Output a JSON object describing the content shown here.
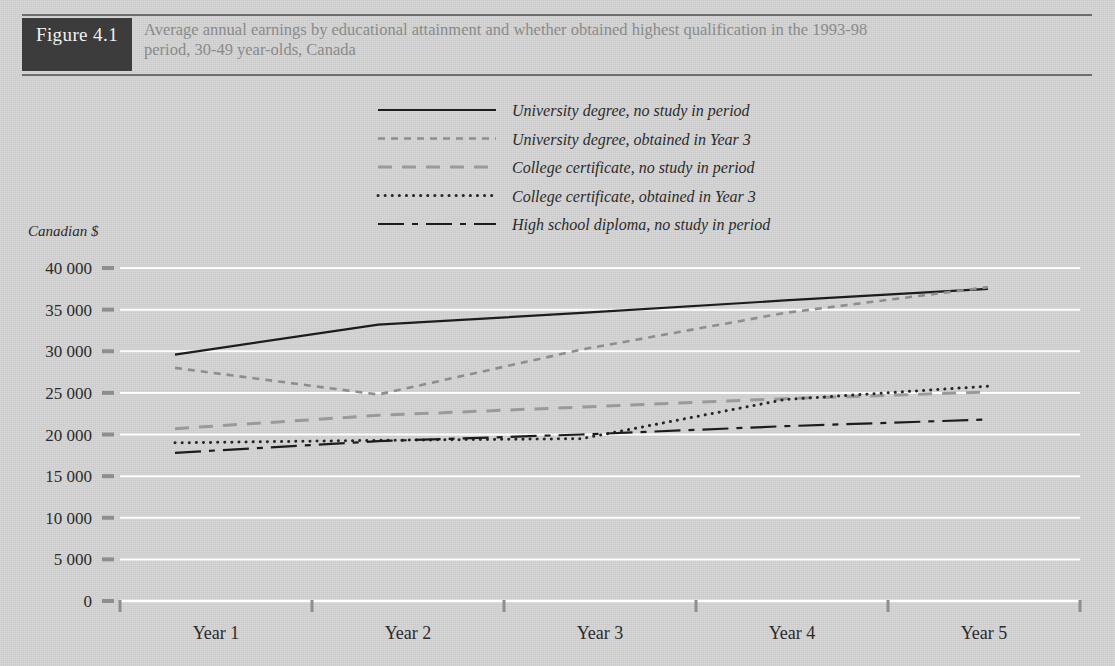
{
  "figure": {
    "badge": "Figure 4.1",
    "title_line1": "Average annual earnings by educational attainment and whether obtained highest qualification in the 1993-98",
    "title_line2": "period, 30-49 year-olds, Canada"
  },
  "colors": {
    "page_background": "#d5d5d5",
    "badge_background": "#3c3c3c",
    "badge_text": "#f2f2f2",
    "title_text": "#8a8a8a",
    "rule": "#6d6d6d",
    "gridline": "#fdfdfd",
    "series_dark": "#1c1c1c",
    "series_mid": "#5a5a5a",
    "series_light": "#9a9a9a"
  },
  "chart_data": {
    "type": "line",
    "title": "Average annual earnings by educational attainment and whether obtained highest qualification in the 1993-98 period, 30-49 year-olds, Canada",
    "xlabel": "",
    "ylabel": "Canadian $",
    "categories": [
      "Year 1",
      "Year 2",
      "Year 3",
      "Year 4",
      "Year 5"
    ],
    "ylim": [
      0,
      40000
    ],
    "ytick_values": [
      0,
      5000,
      10000,
      15000,
      20000,
      25000,
      30000,
      35000,
      40000
    ],
    "ytick_labels": [
      "0",
      "5 000",
      "10 000",
      "15 000",
      "20 000",
      "25 000",
      "30 000",
      "35 000",
      "40 000"
    ],
    "grid": true,
    "legend_position": "top-center",
    "series": [
      {
        "name": "University degree, no study in period",
        "dash": "solid",
        "color": "#1c1c1c",
        "width": 2.2,
        "values": [
          29600,
          33200,
          34600,
          36100,
          37500
        ]
      },
      {
        "name": "University degree, obtained in Year 3",
        "dash": "short-dash",
        "color": "#8e8e8e",
        "width": 2.6,
        "values": [
          28000,
          24800,
          30200,
          34600,
          37700
        ]
      },
      {
        "name": "College certificate, no study in period",
        "dash": "long-dash",
        "color": "#9a9a9a",
        "width": 3.0,
        "values": [
          20700,
          22300,
          23300,
          24300,
          25100
        ]
      },
      {
        "name": "College certificate, obtained in Year 3",
        "dash": "dotted",
        "color": "#262626",
        "width": 3.0,
        "values": [
          19000,
          19300,
          19500,
          24200,
          25800
        ]
      },
      {
        "name": "High school diploma, no study in period",
        "dash": "dash-dot",
        "color": "#1c1c1c",
        "width": 2.2,
        "values": [
          17800,
          19200,
          20000,
          21000,
          21800
        ]
      }
    ]
  }
}
